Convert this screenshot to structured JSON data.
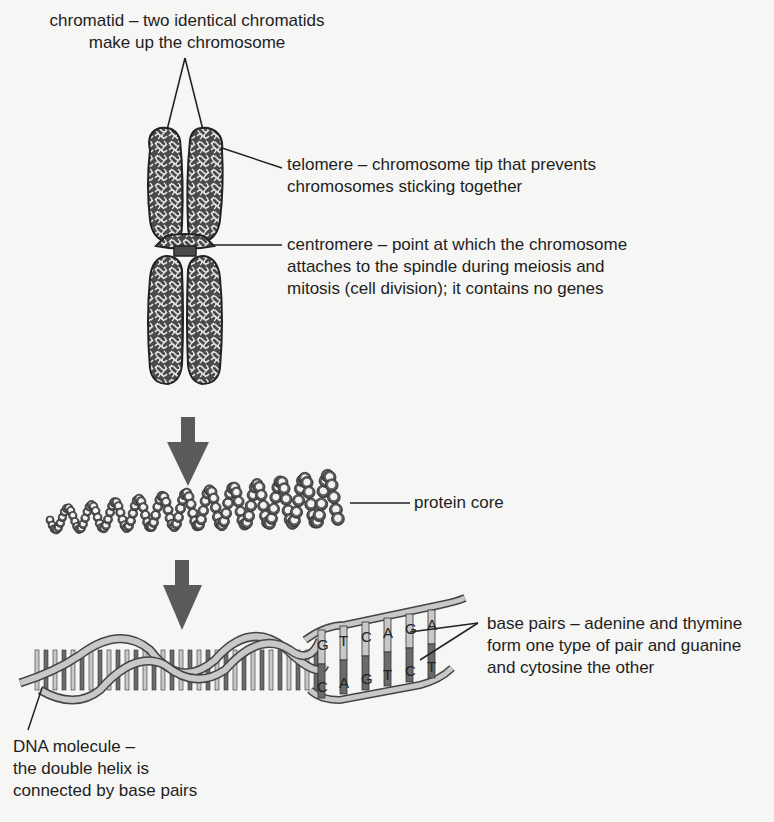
{
  "diagram": {
    "labels": {
      "chromatid": {
        "lines": [
          "chromatid – two identical chromatids",
          "make up the chromosome"
        ]
      },
      "telomere": {
        "lines": [
          "telomere – chromosome tip that prevents",
          "chromosomes sticking together"
        ]
      },
      "centromere": {
        "lines": [
          "centromere – point at which the chromosome",
          "attaches to the spindle during meiosis and",
          "mitosis (cell division); it contains no genes"
        ]
      },
      "protein_core": {
        "lines": [
          "protein core"
        ]
      },
      "base_pairs": {
        "lines": [
          "base pairs – adenine and thymine",
          "form one type of pair and guanine",
          "and cytosine the other"
        ]
      },
      "dna_molecule": {
        "lines": [
          "DNA molecule –",
          "the double helix is",
          "connected by base pairs"
        ]
      }
    },
    "base_pair_letters": [
      {
        "top": "G",
        "bottom": "C"
      },
      {
        "top": "T",
        "bottom": "A"
      },
      {
        "top": "C",
        "bottom": "G"
      },
      {
        "top": "A",
        "bottom": "T"
      },
      {
        "top": "G",
        "bottom": "C"
      },
      {
        "top": "A",
        "bottom": "T"
      }
    ],
    "stages": [
      "chromosome",
      "coiled protein core",
      "DNA double helix"
    ],
    "icons": [
      "down-arrow-icon",
      "down-arrow-icon"
    ],
    "colors": {
      "background": "#f6f6f4",
      "ink": "#1e1e1e",
      "arrow": "#5a5a5a",
      "strand_light": "#c8c8c8",
      "strand_dark": "#6a6a6a"
    }
  }
}
